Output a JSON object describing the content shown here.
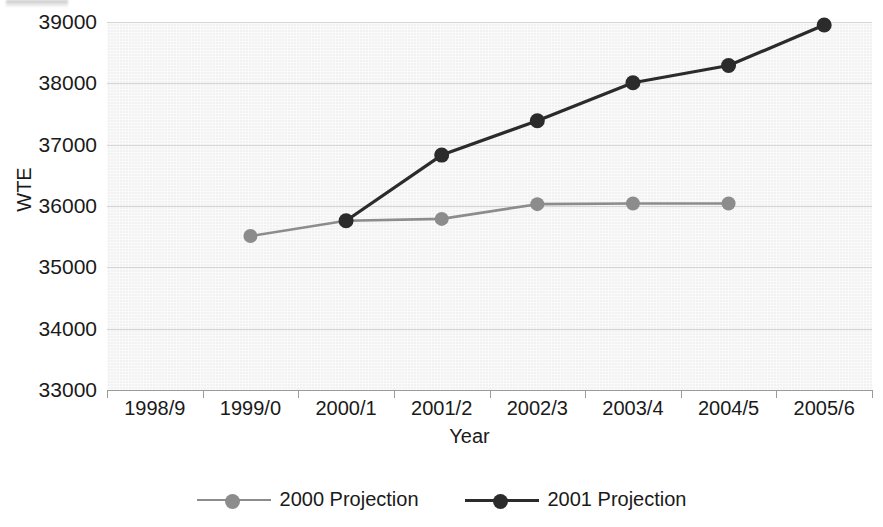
{
  "chart_data": {
    "type": "line",
    "title": "",
    "xlabel": "Year",
    "ylabel": "WTE",
    "categories": [
      "1998/9",
      "1999/0",
      "2000/1",
      "2001/2",
      "2002/3",
      "2003/4",
      "2004/5",
      "2005/6"
    ],
    "ylim": [
      33000,
      39000
    ],
    "ytick_labels": [
      "33000",
      "34000",
      "35000",
      "36000",
      "37000",
      "38000",
      "39000"
    ],
    "ytick_values": [
      33000,
      34000,
      35000,
      36000,
      37000,
      38000,
      39000
    ],
    "grid": true,
    "legend_position": "bottom-center",
    "series": [
      {
        "name": "2000 Projection",
        "color": "#8c8c8c",
        "marker": "circle",
        "x": [
          "1999/0",
          "2000/1",
          "2001/2",
          "2002/3",
          "2003/4",
          "2004/5"
        ],
        "values": [
          35510,
          35760,
          35790,
          36030,
          36040,
          36040
        ]
      },
      {
        "name": "2001 Projection",
        "color": "#2b2b2b",
        "marker": "circle",
        "x": [
          "2000/1",
          "2001/2",
          "2002/3",
          "2003/4",
          "2004/5",
          "2005/6"
        ],
        "values": [
          35760,
          36830,
          37390,
          38010,
          38290,
          38950
        ]
      }
    ]
  },
  "axes": {
    "y_title": "WTE",
    "x_title": "Year"
  },
  "legend": {
    "items": [
      {
        "label": "2000 Projection",
        "color": "#8c8c8c"
      },
      {
        "label": "2001 Projection",
        "color": "#2b2b2b"
      }
    ]
  },
  "colors": {
    "plot_background": "#f2f2f2",
    "gridline": "#d5d5d5",
    "axis": "#9a9a9a",
    "text": "#1a1a1a",
    "series_2000": "#8c8c8c",
    "series_2001": "#2b2b2b"
  }
}
